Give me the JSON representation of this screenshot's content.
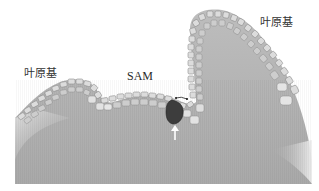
{
  "figure": {
    "type": "biological-diagram"
  },
  "labels": {
    "leaf_primordium_left": "叶原基",
    "sam": "SAM",
    "leaf_primordium_right": "叶原基"
  },
  "annotations": {
    "arrow": "white-up-arrow",
    "highlighted_cell": "dark-founder-cell",
    "arc_marker": "curved-double-arrow"
  },
  "colors": {
    "tissue_body": "#a6a6a6",
    "tissue_light": "#cfcfcf",
    "cell_fill": "#d9d9d9",
    "cell_border": "#8a8a8a",
    "highlight_cell": "#3a3a3a",
    "arrow": "#ffffff",
    "background": "#ffffff"
  }
}
